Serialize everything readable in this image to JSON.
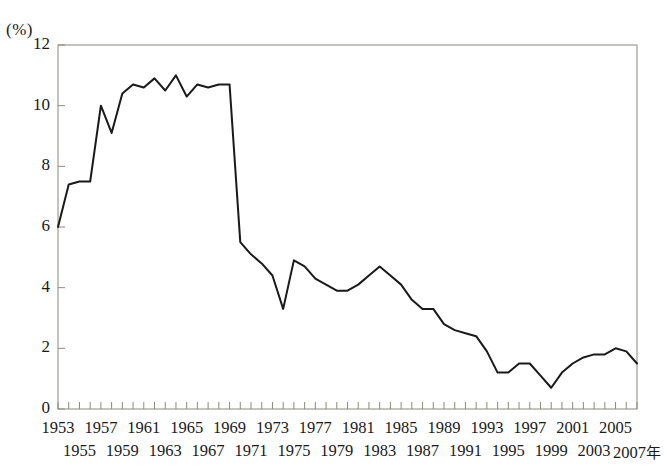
{
  "chart_data": {
    "type": "line",
    "title": "",
    "xlabel": "年",
    "ylabel": "(%)",
    "unit_label": "(%)",
    "ylim": [
      0,
      12
    ],
    "yticks": [
      0,
      2,
      4,
      6,
      8,
      10,
      12
    ],
    "ytick_labels": [
      "0",
      "2",
      "4",
      "6",
      "8",
      "10",
      "12"
    ],
    "grid": false,
    "legend": false,
    "legend_position": "none",
    "x_axis_end_label": "2007年",
    "x_label_row_top": [
      "1953",
      "1957",
      "1961",
      "1965",
      "1969",
      "1973",
      "1977",
      "1981",
      "1985",
      "1989",
      "1993",
      "1997",
      "2001",
      "2005"
    ],
    "x_label_row_bottom": [
      "1955",
      "1959",
      "1963",
      "1967",
      "1971",
      "1975",
      "1979",
      "1983",
      "1987",
      "1991",
      "1995",
      "1999",
      "2003",
      "2007年"
    ],
    "x": [
      1953,
      1954,
      1955,
      1956,
      1957,
      1958,
      1959,
      1960,
      1961,
      1962,
      1963,
      1964,
      1965,
      1966,
      1967,
      1968,
      1969,
      1970,
      1971,
      1972,
      1973,
      1974,
      1975,
      1976,
      1977,
      1978,
      1979,
      1980,
      1981,
      1982,
      1983,
      1984,
      1985,
      1986,
      1987,
      1988,
      1989,
      1990,
      1991,
      1992,
      1993,
      1994,
      1995,
      1996,
      1997,
      1998,
      1999,
      2000,
      2001,
      2002,
      2003,
      2004,
      2005,
      2006,
      2007
    ],
    "values": [
      6.0,
      7.4,
      7.5,
      7.5,
      10.0,
      9.1,
      10.4,
      10.7,
      10.6,
      10.9,
      10.5,
      11.0,
      10.3,
      10.7,
      10.6,
      10.7,
      10.7,
      5.5,
      5.1,
      4.8,
      4.4,
      3.3,
      4.9,
      4.7,
      4.3,
      4.1,
      3.9,
      3.9,
      4.1,
      4.4,
      4.7,
      4.4,
      4.1,
      3.6,
      3.3,
      3.3,
      2.8,
      2.6,
      2.5,
      2.4,
      1.9,
      1.2,
      1.2,
      1.5,
      1.5,
      1.1,
      0.7,
      1.2,
      1.5,
      1.7,
      1.8,
      1.8,
      2.0,
      1.9,
      1.5
    ],
    "series_name": "成長率",
    "line_color": "#1a1a1a",
    "line_width": 2,
    "axis_color": "#8a8a7e",
    "background": "#ffffff"
  },
  "plot_geometry": {
    "left": 58,
    "right": 637,
    "top": 45,
    "bottom": 409
  }
}
